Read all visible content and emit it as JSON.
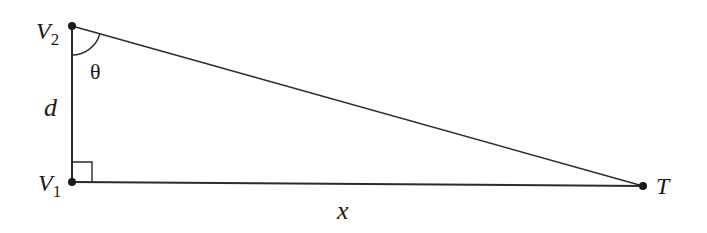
{
  "diagram": {
    "type": "right-triangle",
    "colors": {
      "stroke": "#2b2b2b",
      "text": "#1a1a1a",
      "background": "#ffffff"
    },
    "vertices": [
      {
        "id": "V2",
        "label": "V",
        "subscript": "2",
        "x": 72,
        "y": 26
      },
      {
        "id": "V1",
        "label": "V",
        "subscript": "1",
        "x": 72,
        "y": 182
      },
      {
        "id": "T",
        "label": "T",
        "x": 643,
        "y": 186
      }
    ],
    "edges": [
      {
        "from": "V2",
        "to": "V1",
        "label": "d"
      },
      {
        "from": "V1",
        "to": "T",
        "label": "x"
      },
      {
        "from": "V2",
        "to": "T",
        "label": ""
      }
    ],
    "angles": [
      {
        "at": "V2",
        "label": "θ",
        "marker": "arc"
      },
      {
        "at": "V1",
        "label": "",
        "marker": "right-angle"
      }
    ]
  },
  "labels": {
    "v2_main": "V",
    "v2_sub": "2",
    "v1_main": "V",
    "v1_sub": "1",
    "t": "T",
    "d": "d",
    "x": "x",
    "theta": "θ"
  }
}
